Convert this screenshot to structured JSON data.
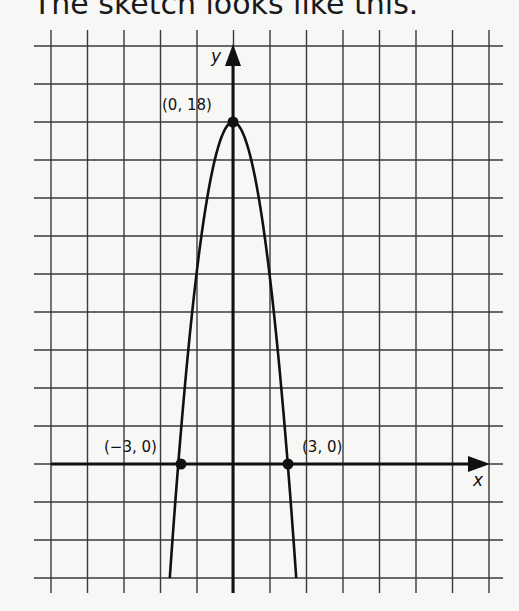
{
  "heading": "The sketch looks like this.",
  "chart_data": {
    "type": "line",
    "title": "The sketch looks like this.",
    "xlabel": "x",
    "ylabel": "y",
    "function": "y = 18 - 2x^2",
    "grid": true,
    "x_grid_step": 2,
    "y_grid_step": 2,
    "xlim": [
      -10,
      14
    ],
    "ylim": [
      -6,
      22
    ],
    "series": [
      {
        "name": "parabola",
        "x": [
          -3.46,
          -3,
          -2,
          -1,
          0,
          1,
          2,
          3,
          3.46
        ],
        "y": [
          -6,
          0,
          10,
          16,
          18,
          16,
          10,
          0,
          -6
        ]
      }
    ],
    "points": [
      {
        "label": "(0, 18)",
        "x": 0,
        "y": 18
      },
      {
        "label": "(−3, 0)",
        "x": -3,
        "y": 0
      },
      {
        "label": "(3, 0)",
        "x": 3,
        "y": 0
      }
    ],
    "annotations": [
      "(0, 18)",
      "(−3, 0)",
      "(3, 0)"
    ]
  },
  "labels": {
    "x_axis": "x",
    "y_axis": "y",
    "vertex": "(0, 18)",
    "left_root": "(−3, 0)",
    "right_root": "(3, 0)"
  },
  "colors": {
    "grid": "#3a3a3a",
    "axis": "#111111",
    "curve": "#111111",
    "background": "#f7f7f5"
  }
}
